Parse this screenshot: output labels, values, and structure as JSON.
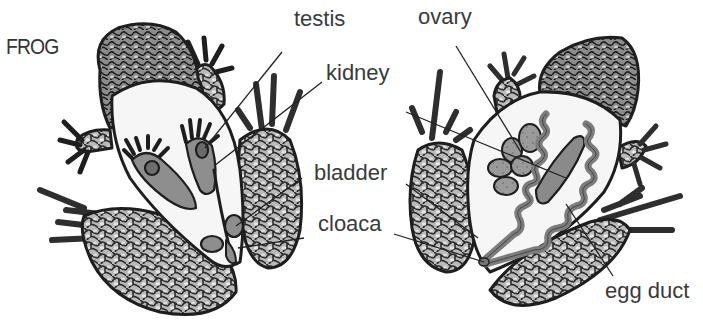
{
  "title": "FROG",
  "male": {
    "labels": {
      "testis": "testis",
      "kidney": "kidney",
      "bladder": "bladder",
      "cloaca": "cloaca"
    }
  },
  "female": {
    "labels": {
      "ovary": "ovary",
      "egg_duct": "egg duct"
    }
  },
  "colors": {
    "outline": "#1e1e1e",
    "skin_pattern": "#6a6a6a",
    "belly": "#f4f4f4",
    "organ": "#8a8a8a",
    "text": "#3a3a3a"
  }
}
